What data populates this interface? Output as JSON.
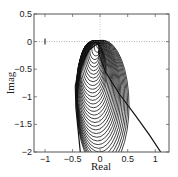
{
  "chart_data": {
    "type": "line",
    "title": "",
    "xlabel": "Real",
    "ylabel": "Imag",
    "xlim": [
      -1.2,
      1.25
    ],
    "ylim": [
      -2,
      0.5
    ],
    "xticks": [
      -1,
      -0.5,
      0,
      0.5,
      1
    ],
    "xtick_labels": [
      "-1",
      "-0.5",
      "0",
      "0.5",
      "1"
    ],
    "yticks": [
      0.5,
      0,
      -0.5,
      -1,
      -1.5,
      -2
    ],
    "ytick_labels": [
      "0.5",
      "0",
      "-0.5",
      "-1",
      "-1.5",
      "-2"
    ],
    "grid": false,
    "reference_lines": {
      "horizontal_dotted_at": 0,
      "vertical_dotted_at": 0
    },
    "markers": [
      {
        "x": -1,
        "y": 0,
        "label": "critical point (-1,0)",
        "style": "vertical tick"
      }
    ],
    "series": [
      {
        "name": "Nyquist loci family (overlapping circles)",
        "envelope_left": {
          "x": [
            0,
            -0.2,
            -0.38,
            -0.45,
            -0.44,
            -0.4,
            -0.36
          ],
          "y": [
            0,
            -0.15,
            -0.45,
            -0.8,
            -1.2,
            -1.6,
            -2
          ]
        },
        "envelope_right": {
          "x": [
            0,
            -0.03,
            0.1,
            0.35,
            0.65,
            0.9,
            1.1
          ],
          "y": [
            0,
            -0.2,
            -0.55,
            -0.95,
            -1.35,
            -1.7,
            -2
          ]
        }
      }
    ]
  }
}
